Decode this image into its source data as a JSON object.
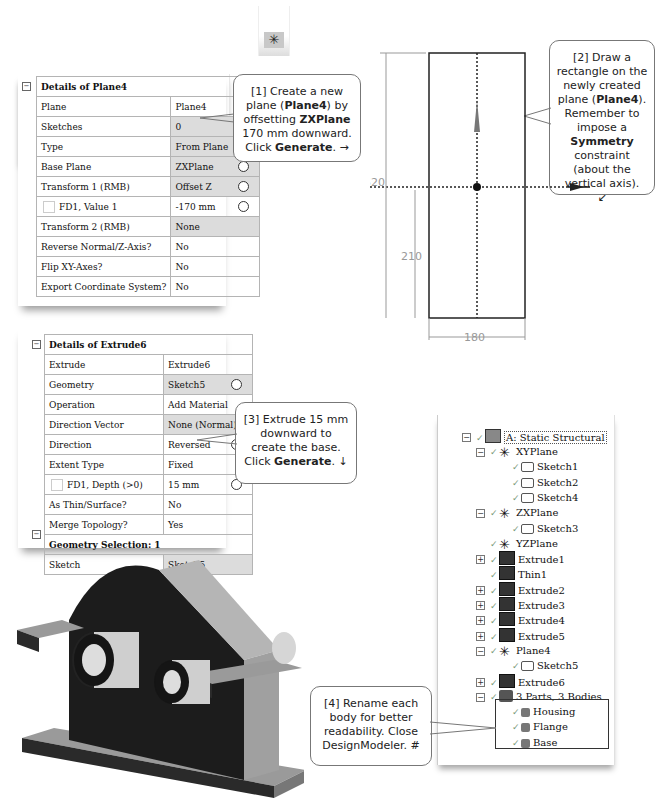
{
  "toolbar": {
    "new_plane_icon": "new-plane-icon",
    "glyph": "✳"
  },
  "plane_details": {
    "title": "Details of Plane4",
    "rows": [
      {
        "label": "Plane",
        "value": "Plane4",
        "shaded": false,
        "radio": false
      },
      {
        "label": "Sketches",
        "value": "0",
        "shaded": true,
        "radio": false
      },
      {
        "label": "Type",
        "value": "From Plane",
        "shaded": true,
        "radio": false
      },
      {
        "label": "Base Plane",
        "value": "ZXPlane",
        "shaded": true,
        "radio": true
      },
      {
        "label": "Transform 1 (RMB)",
        "value": "Offset Z",
        "shaded": true,
        "radio": true
      },
      {
        "label": "FD1, Value 1",
        "value": "-170 mm",
        "shaded": false,
        "radio": true,
        "checkbox": true
      },
      {
        "label": "Transform 2 (RMB)",
        "value": "None",
        "shaded": true,
        "radio": false
      },
      {
        "label": "Reverse Normal/Z-Axis?",
        "value": "No",
        "shaded": false,
        "radio": false
      },
      {
        "label": "Flip XY-Axes?",
        "value": "No",
        "shaded": false,
        "radio": false
      },
      {
        "label": "Export Coordinate System?",
        "value": "No",
        "shaded": false,
        "radio": false
      }
    ]
  },
  "extrude_details": {
    "title": "Details of Extrude6",
    "rows": [
      {
        "label": "Extrude",
        "value": "Extrude6",
        "shaded": false,
        "radio": false
      },
      {
        "label": "Geometry",
        "value": "Sketch5",
        "shaded": true,
        "radio": true
      },
      {
        "label": "Operation",
        "value": "Add Material",
        "shaded": false,
        "radio": false
      },
      {
        "label": "Direction Vector",
        "value": "None (Normal)",
        "shaded": true,
        "radio": false
      },
      {
        "label": "Direction",
        "value": "Reversed",
        "shaded": false,
        "radio": true
      },
      {
        "label": "Extent Type",
        "value": "Fixed",
        "shaded": false,
        "radio": false
      },
      {
        "label": "FD1, Depth (>0)",
        "value": "15 mm",
        "shaded": false,
        "radio": true,
        "checkbox": true
      },
      {
        "label": "As Thin/Surface?",
        "value": "No",
        "shaded": false,
        "radio": false
      },
      {
        "label": "Merge Topology?",
        "value": "Yes",
        "shaded": false,
        "radio": false
      }
    ],
    "section2_title": "Geometry Selection: 1",
    "section2_rows": [
      {
        "label": "Sketch",
        "value": "Sketch5",
        "shaded": true
      }
    ]
  },
  "callouts": {
    "c1": {
      "pre": "[1] Create a new plane (",
      "b1": "Plane4",
      "mid1": ") by offsetting ",
      "b2": "ZXPlane",
      "mid2": " 170 mm downward. Click ",
      "b3": "Generate",
      "post": ". →"
    },
    "c2": {
      "pre": "[2] Draw a rectangle on the newly created plane (",
      "b1": "Plane4",
      "mid1": "). Remember to impose a ",
      "b2": "Symmetry",
      "post": " constraint (about the vertical axis).",
      "arrow": "↙"
    },
    "c3": {
      "pre": "[3] Extrude 15 mm downward to create the base. Click ",
      "b1": "Generate",
      "post": ". ↓"
    },
    "c4": {
      "text": "[4] Rename each body for better readability. Close DesignModeler. #"
    }
  },
  "sketch": {
    "dim_height": "520",
    "dim_offset": "210",
    "dim_width": "180"
  },
  "tree": {
    "root": "A: Static Structural",
    "items": [
      {
        "label": "XYPlane",
        "level": 1,
        "icon": "plane-icon",
        "expander": "−"
      },
      {
        "label": "Sketch1",
        "level": 2,
        "icon": "sketch-icon"
      },
      {
        "label": "Sketch2",
        "level": 2,
        "icon": "sketch-icon"
      },
      {
        "label": "Sketch4",
        "level": 2,
        "icon": "sketch-icon"
      },
      {
        "label": "ZXPlane",
        "level": 1,
        "icon": "plane-icon",
        "expander": "−"
      },
      {
        "label": "Sketch3",
        "level": 2,
        "icon": "sketch-icon"
      },
      {
        "label": "YZPlane",
        "level": 1,
        "icon": "plane-icon"
      },
      {
        "label": "Extrude1",
        "level": 1,
        "icon": "extrude-icon",
        "expander": "+"
      },
      {
        "label": "Thin1",
        "level": 1,
        "icon": "thin-icon"
      },
      {
        "label": "Extrude2",
        "level": 1,
        "icon": "extrude-icon",
        "expander": "+"
      },
      {
        "label": "Extrude3",
        "level": 1,
        "icon": "extrude-icon",
        "expander": "+"
      },
      {
        "label": "Extrude4",
        "level": 1,
        "icon": "extrude-icon",
        "expander": "+"
      },
      {
        "label": "Extrude5",
        "level": 1,
        "icon": "extrude-icon",
        "expander": "+"
      },
      {
        "label": "Plane4",
        "level": 1,
        "icon": "plane-icon",
        "expander": "−"
      },
      {
        "label": "Sketch5",
        "level": 2,
        "icon": "sketch-icon"
      },
      {
        "label": "Extrude6",
        "level": 1,
        "icon": "extrude-icon",
        "expander": "+"
      },
      {
        "label": "3 Parts, 3 Bodies",
        "level": 1,
        "icon": "parts-icon",
        "expander": "−"
      },
      {
        "label": "Housing",
        "level": 2,
        "icon": "body-icon"
      },
      {
        "label": "Flange",
        "level": 2,
        "icon": "body-icon"
      },
      {
        "label": "Base",
        "level": 2,
        "icon": "body-icon"
      }
    ]
  }
}
